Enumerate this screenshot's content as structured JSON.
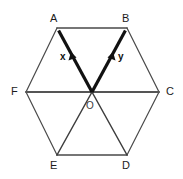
{
  "figure": {
    "name": "regular-hexagon-vector-diagram",
    "background_color": "#ffffff",
    "width": 183,
    "height": 179
  },
  "style": {
    "thin_stroke_color": "#4a4a4a",
    "thin_stroke_width": 1,
    "bold_stroke_color": "#111111",
    "bold_stroke_width": 3.2,
    "label_color": "#1b1b1b"
  },
  "hexagon": {
    "center": {
      "x": 92,
      "y": 92
    },
    "vertices": [
      {
        "label": "A",
        "x": 57,
        "y": 28,
        "label_x": 50,
        "label_y": 13
      },
      {
        "label": "B",
        "x": 127,
        "y": 28,
        "label_x": 122,
        "label_y": 13
      },
      {
        "label": "C",
        "x": 159,
        "y": 92,
        "label_x": 166,
        "label_y": 86
      },
      {
        "label": "D",
        "x": 127,
        "y": 155,
        "label_x": 122,
        "label_y": 160
      },
      {
        "label": "E",
        "x": 57,
        "y": 155,
        "label_x": 50,
        "label_y": 160
      },
      {
        "label": "F",
        "x": 26,
        "y": 92,
        "label_x": 11,
        "label_y": 86
      }
    ],
    "center_label": {
      "text": "O",
      "x": 86,
      "y": 101
    }
  },
  "edges": [
    {
      "name": "edge-AB",
      "from": "A",
      "to": "B",
      "weight": "thin"
    },
    {
      "name": "edge-BC",
      "from": "B",
      "to": "C",
      "weight": "thin"
    },
    {
      "name": "edge-CD",
      "from": "C",
      "to": "D",
      "weight": "thin"
    },
    {
      "name": "edge-DE",
      "from": "D",
      "to": "E",
      "weight": "thin"
    },
    {
      "name": "edge-EF",
      "from": "E",
      "to": "F",
      "weight": "thin"
    },
    {
      "name": "edge-FA",
      "from": "F",
      "to": "A",
      "weight": "thin"
    }
  ],
  "interior_segments": [
    {
      "name": "diameter-FC",
      "from": "F",
      "to": "C",
      "weight": "thin"
    },
    {
      "name": "segment-OE",
      "from": "O",
      "to": "E",
      "weight": "thin"
    },
    {
      "name": "segment-OD",
      "from": "O",
      "to": "D",
      "weight": "thin"
    }
  ],
  "vectors": [
    {
      "name": "vector-x",
      "label": "x",
      "from": "O",
      "to": "A",
      "weight": "bold",
      "arrow_at": "A",
      "label_x": 60,
      "label_y": 52
    },
    {
      "name": "vector-y",
      "label": "y",
      "from": "O",
      "to": "B",
      "weight": "bold",
      "arrow_at": "B",
      "label_x": 118,
      "label_y": 52
    }
  ]
}
